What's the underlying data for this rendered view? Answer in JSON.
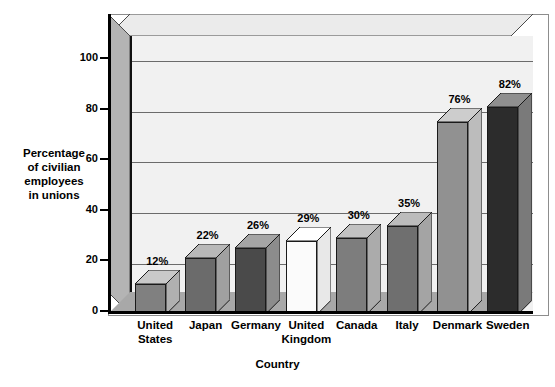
{
  "chart_data": {
    "type": "bar",
    "title": "",
    "xlabel": "Country",
    "ylabel": "Percentage of civilian employees in unions",
    "ylabel_lines": [
      "Percentage",
      "of civilian",
      "employees",
      "in unions"
    ],
    "categories": [
      "United States",
      "Japan",
      "Germany",
      "United Kingdom",
      "Canada",
      "Italy",
      "Denmark",
      "Sweden"
    ],
    "category_lines": [
      [
        "United",
        "States"
      ],
      [
        "Japan"
      ],
      [
        "Germany"
      ],
      [
        "United",
        "Kingdom"
      ],
      [
        "Canada"
      ],
      [
        "Italy"
      ],
      [
        "Denmark"
      ],
      [
        "Sweden"
      ]
    ],
    "values": [
      12,
      22,
      26,
      29,
      30,
      35,
      76,
      82
    ],
    "data_labels": [
      "12%",
      "22%",
      "26%",
      "29%",
      "30%",
      "35%",
      "76%",
      "82%"
    ],
    "ylim": [
      0,
      110
    ],
    "yticks": [
      0,
      20,
      40,
      60,
      80,
      100
    ],
    "ytick_labels": [
      "0",
      "20",
      "40",
      "60",
      "80",
      "100"
    ],
    "grid": true,
    "legend": "none",
    "style": "3d-bar",
    "bar_colors": [
      "#808080",
      "#6b6b6b",
      "#4a4a4a",
      "#fbfbfb",
      "#7d7d7d",
      "#6f6f6f",
      "#919191",
      "#2c2c2c"
    ],
    "bar_top_colors": [
      "#c9c9c9",
      "#b8b8b8",
      "#a5a5a5",
      "#ffffff",
      "#c2c2c2",
      "#bcbcbc",
      "#cdcdcd",
      "#8f8f8f"
    ],
    "bar_side_colors": [
      "#b0b0b0",
      "#a0a0a0",
      "#8c8c8c",
      "#e8e8e8",
      "#ababab",
      "#a4a4a4",
      "#bcbcbc",
      "#7a7a7a"
    ],
    "plot_bg": "#f1f1f1",
    "gridline_color": "#6b6b6b",
    "axis_color": "#000000"
  }
}
